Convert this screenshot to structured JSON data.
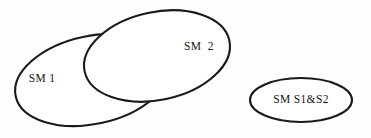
{
  "diagram": {
    "type": "venn",
    "title": "",
    "background_color": "#fefefe",
    "stroke_color": "#1a1a1a",
    "stroke_width": 2.1,
    "intersection_fill": "#cdcdcd",
    "set_fill": "#ffffff",
    "sets": [
      {
        "id": "sm1",
        "label": "SM 1",
        "label_x": 42,
        "label_y": 79,
        "cx": 92,
        "cy": 80,
        "rx": 78,
        "ry": 44,
        "rotation": -12,
        "fill": "#ffffff"
      },
      {
        "id": "sm2",
        "label": "SM  2",
        "label_x": 199,
        "label_y": 47,
        "cx": 157,
        "cy": 56,
        "rx": 74,
        "ry": 44,
        "rotation": -12,
        "fill": "#ffffff"
      },
      {
        "id": "sm_s1_s2",
        "label": "SM S1&S2",
        "label_x": 301,
        "label_y": 100,
        "cx": 301,
        "cy": 100,
        "rx": 51,
        "ry": 22,
        "rotation": 0,
        "fill": "#ffffff"
      }
    ],
    "regions": [
      {
        "id": "sm1-sm2-intersection",
        "label": "",
        "fill": "#cdcdcd",
        "shaded": true
      }
    ]
  }
}
